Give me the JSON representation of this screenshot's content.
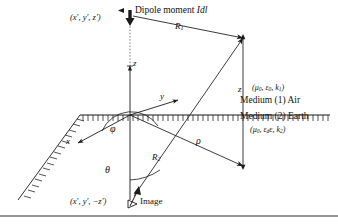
{
  "figure": {
    "type": "electromagnetic-geometry-diagram",
    "ink_color": "#1a1a1a",
    "background": "#ffffff"
  },
  "labels": {
    "source_coordinate": "(x′, y′, z′)",
    "dipole_title_text": "Dipole moment ",
    "dipole_title_symbol": "Idl",
    "distance_r1": "R",
    "distance_r1_sub": "1",
    "distance_r2": "R",
    "distance_r2_sub": "2",
    "axis_z": "z",
    "axis_y": "y",
    "axis_x": "x",
    "angle_phi": "φ",
    "angle_theta": "θ",
    "radial_rho": "ρ",
    "height_z": "z",
    "image_coordinate": "(x′, y′, −z′)",
    "image_text": "Image"
  },
  "media": {
    "upper": {
      "name": "Medium (1) Air",
      "params_open": "(",
      "mu": "μ",
      "mu_sub": "0",
      "eps": "ε",
      "eps_sub": "0",
      "k": "k",
      "k_sub": "1",
      "params_close": ")"
    },
    "lower": {
      "name": "Medium (2) Earth",
      "params_open": "(",
      "mu": "μ",
      "mu_sub": "0",
      "eps": "ε",
      "eps_sub": "d",
      "eps2": "ε",
      "k": "k",
      "k_sub": "2",
      "params_close": ")"
    }
  }
}
